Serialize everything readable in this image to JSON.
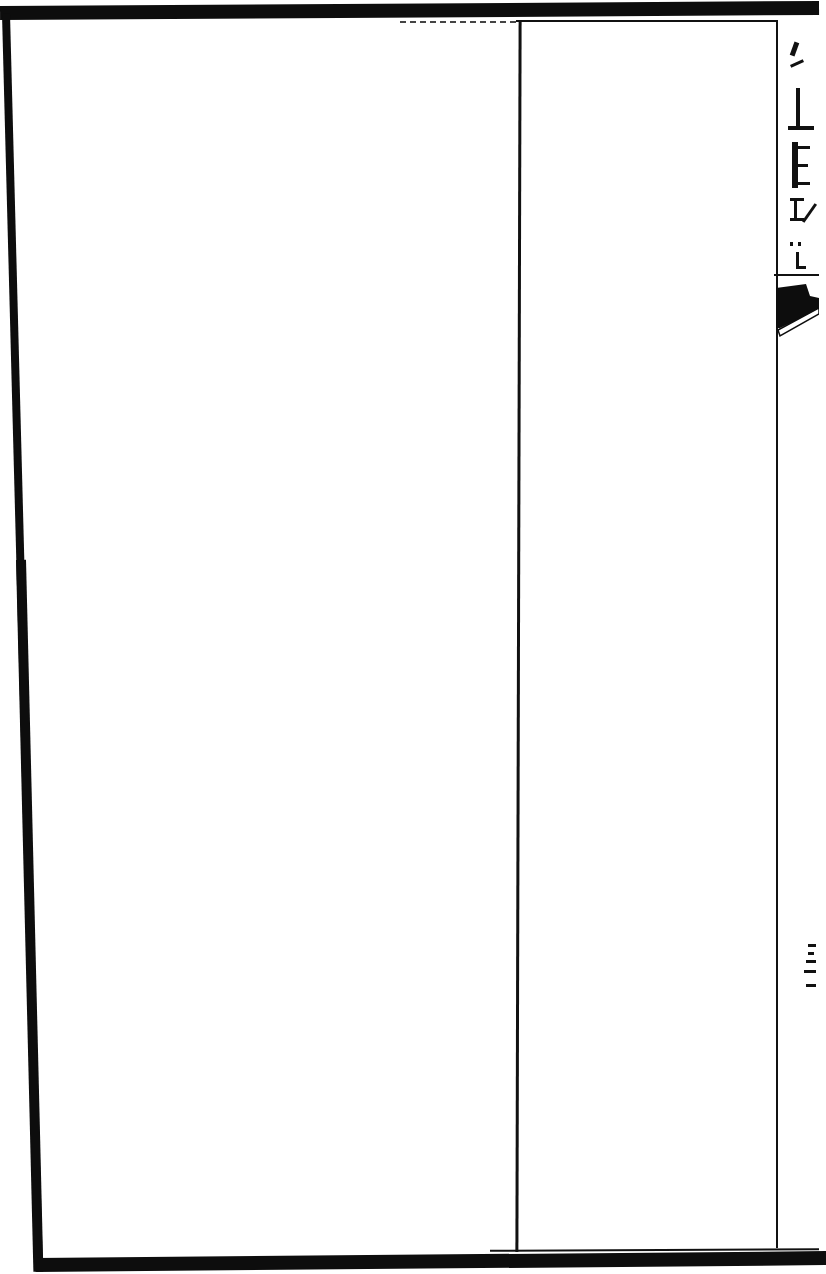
{
  "document": {
    "type": "scanned woodblock-printed book page",
    "content": "blank leaf",
    "layout": {
      "frame": "single thick outer border",
      "columns": 2,
      "fold_strip": "right edge (版心) with partial title, fish-tail mark and page number"
    },
    "fold_strip": {
      "title_text": "",
      "title_note": "partial characters cut off at right edge, illegible",
      "fishtail_mark": "black fish-tail (魚尾)",
      "page_number_note": "illegible stroke marks"
    },
    "colors": {
      "ink": "#0d0d0d",
      "paper": "#ffffff"
    }
  }
}
